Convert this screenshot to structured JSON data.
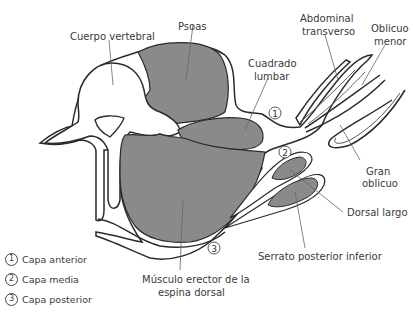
{
  "diagram": {
    "type": "anatomical cross-section",
    "fill_color": "#8a8a8a",
    "line_color": "#2a2a2a",
    "labels": {
      "cuerpo_vertebral": "Cuerpo vertebral",
      "psoas": "Psoas",
      "abdominal_transverso_1": "Abdominal",
      "abdominal_transverso_2": "transverso",
      "oblicuo_menor_1": "Oblicuo",
      "oblicuo_menor_2": "menor",
      "cuadrado_lumbar_1": "Cuadrado",
      "cuadrado_lumbar_2": "lumbar",
      "gran_oblicuo_1": "Gran",
      "gran_oblicuo_2": "oblicuo",
      "dorsal_largo": "Dorsal largo",
      "serrato": "Serrato posterior inferior",
      "erector_1": "Músculo erector de la",
      "erector_2": "espina dorsal"
    },
    "markers": {
      "m1": "1",
      "m2": "2",
      "m3": "3"
    }
  },
  "legend": {
    "items": [
      {
        "num": "1",
        "label": "Capa anterior"
      },
      {
        "num": "2",
        "label": "Capa media"
      },
      {
        "num": "3",
        "label": "Capa posterior"
      }
    ]
  }
}
